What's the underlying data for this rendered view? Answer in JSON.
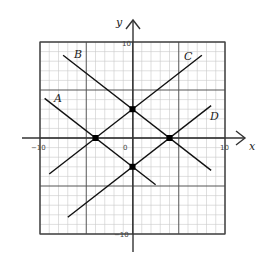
{
  "chart_data": {
    "type": "line",
    "title": "",
    "xlabel": "x",
    "ylabel": "y",
    "xlim": [
      -10,
      10
    ],
    "ylim": [
      -10,
      10
    ],
    "grid": true,
    "minor_grid_step": 1,
    "major_grid_step": 5,
    "tick_labels": {
      "x_neg": "-10",
      "x_pos": "10",
      "y_pos": "10",
      "y_neg": "-10",
      "origin": "0"
    },
    "series": [
      {
        "name": "A",
        "slope": -0.75,
        "intercept": -3,
        "x_range": [
          -9.5,
          2.5
        ]
      },
      {
        "name": "B",
        "slope": -0.75,
        "intercept": 3,
        "x_range": [
          -7.5,
          8.5
        ]
      },
      {
        "name": "C",
        "slope": 0.75,
        "intercept": 3,
        "x_range": [
          -9,
          7.5
        ]
      },
      {
        "name": "D",
        "slope": 0.75,
        "intercept": -3,
        "x_range": [
          -7,
          8.5
        ]
      }
    ],
    "points": [
      {
        "label": "",
        "x": -4,
        "y": 0
      },
      {
        "label": "",
        "x": 0,
        "y": 3
      },
      {
        "label": "",
        "x": 4,
        "y": 0
      },
      {
        "label": "",
        "x": 0,
        "y": -3
      }
    ]
  },
  "labels": {
    "x_axis": "x",
    "y_axis": "y",
    "x_neg": "−10",
    "x_pos": "10",
    "y_pos": "10",
    "y_neg": "−10",
    "origin": "0",
    "line_a": "A",
    "line_b": "B",
    "line_c": "C",
    "line_d": "D"
  }
}
